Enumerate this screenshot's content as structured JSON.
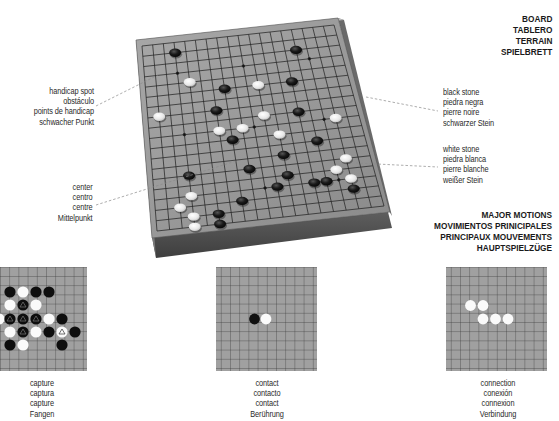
{
  "board_heading": {
    "lines": [
      "BOARD",
      "TABLERO",
      "TERRAIN",
      "SPIELBRETT"
    ]
  },
  "motions_heading": {
    "lines": [
      "MAJOR MOTIONS",
      "MOVIMIENTOS PRINICIPALES",
      "PRINCIPAUX MOUVEMENTS",
      "HAUPTSPIELZÜGE"
    ]
  },
  "callouts": {
    "handicap_spot": [
      "handicap spot",
      "obstáculo",
      "points de handicap",
      "schwacher Punkt"
    ],
    "center": [
      "center",
      "centro",
      "centre",
      "Mittelpunkt"
    ],
    "black_stone": [
      "black stone",
      "piedra negra",
      "pierre noire",
      "schwarzer Stein"
    ],
    "white_stone": [
      "white stone",
      "piedra blanca",
      "pierre blanche",
      "weißer Stein"
    ]
  },
  "motions": [
    {
      "id": "capture",
      "labels": [
        "capture",
        "captura",
        "capture",
        "Fangen"
      ]
    },
    {
      "id": "contact",
      "labels": [
        "contact",
        "contacto",
        "contact",
        "Berührung"
      ]
    },
    {
      "id": "connection",
      "labels": [
        "connection",
        "conexión",
        "connexion",
        "Verbindung"
      ]
    }
  ],
  "colors": {
    "board_surface": "#9a9a9a",
    "board_grid": "#2b2b2b",
    "board_side": "#5a5a5a",
    "black_stone": "#111111",
    "white_stone": "#f4f4f4",
    "leader_line": "#888888"
  }
}
